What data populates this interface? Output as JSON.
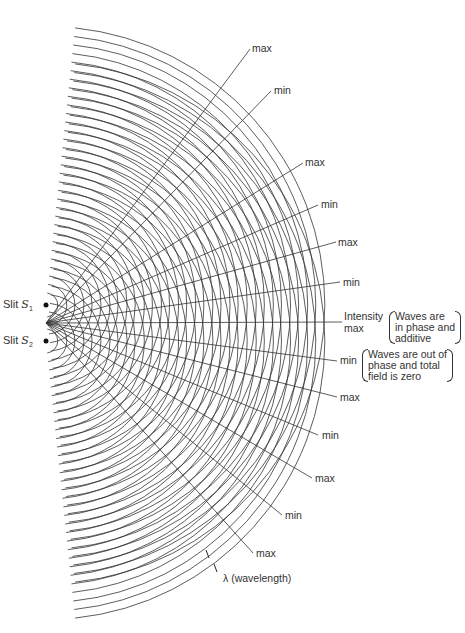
{
  "figure": {
    "slits": [
      {
        "id": "S1",
        "label_prefix": "Slit ",
        "symbol": "S",
        "sub": "1",
        "x": 46,
        "y": 305
      },
      {
        "id": "S2",
        "label_prefix": "Slit ",
        "symbol": "S",
        "sub": "2",
        "x": 46,
        "y": 341
      }
    ],
    "center": {
      "x": 46,
      "y": 323
    },
    "wavelength_px": 8.6,
    "min_radius": 12,
    "max_radius": 284,
    "arc_half_angle_deg": 84,
    "line_color": "#333333",
    "fringe_labels": [
      {
        "text": "max",
        "x": 252,
        "y": 43,
        "lx": 250,
        "ly": 49
      },
      {
        "text": "min",
        "x": 274,
        "y": 85,
        "lx": 271,
        "ly": 91
      },
      {
        "text": "max",
        "x": 305,
        "y": 157,
        "lx": 303,
        "ly": 163
      },
      {
        "text": "min",
        "x": 321,
        "y": 199,
        "lx": 318,
        "ly": 205
      },
      {
        "text": "max",
        "x": 338,
        "y": 237,
        "lx": 336,
        "ly": 242
      },
      {
        "text": "min",
        "x": 343,
        "y": 277,
        "lx": 340,
        "ly": 282
      },
      {
        "text": "Intensity",
        "x": 344,
        "y": 311,
        "lx": 342,
        "ly": 322
      },
      {
        "text": "max",
        "x": 344,
        "y": 323,
        "lx": null,
        "ly": null
      },
      {
        "text": "min",
        "x": 340,
        "y": 355,
        "lx": 337,
        "ly": 361
      },
      {
        "text": "max",
        "x": 340,
        "y": 392,
        "lx": 337,
        "ly": 397
      },
      {
        "text": "min",
        "x": 322,
        "y": 430,
        "lx": 318,
        "ly": 435
      },
      {
        "text": "max",
        "x": 315,
        "y": 473,
        "lx": 312,
        "ly": 478
      },
      {
        "text": "min",
        "x": 285,
        "y": 510,
        "lx": 282,
        "ly": 515
      },
      {
        "text": "max",
        "x": 256,
        "y": 548,
        "lx": 253,
        "ly": 553
      }
    ],
    "notes": [
      {
        "lines": [
          "Waves are",
          "in phase and",
          "additive"
        ],
        "x": 389,
        "y": 311
      },
      {
        "lines": [
          "Waves are out of",
          "phase and total",
          "field is zero"
        ],
        "x": 362,
        "y": 349
      }
    ],
    "wavelength_label": {
      "text": "λ (wavelength)",
      "x": 223,
      "y": 578
    }
  }
}
